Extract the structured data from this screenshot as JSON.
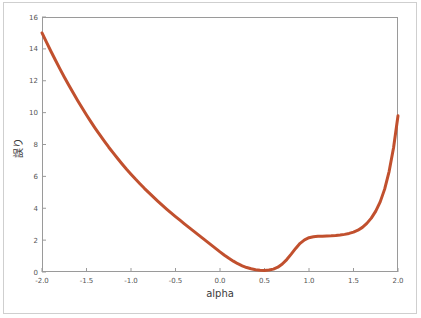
{
  "figure": {
    "background_color": "#ffffff",
    "border_color": "#cfcfcf",
    "axes_color": "#9a9a9a"
  },
  "chart_data": {
    "type": "line",
    "title": "",
    "xlabel": "alpha",
    "ylabel": "誤り",
    "xlim": [
      -2.0,
      2.0
    ],
    "ylim": [
      0,
      16
    ],
    "grid": false,
    "legend": null,
    "xticks": [
      "-2.0",
      "-1.5",
      "-1.0",
      "-0.5",
      "0.0",
      "0.5",
      "1.0",
      "1.5",
      "2.0"
    ],
    "xtick_values": [
      -2.0,
      -1.5,
      -1.0,
      -0.5,
      0.0,
      0.5,
      1.0,
      1.5,
      2.0
    ],
    "yticks": [
      "0",
      "2",
      "4",
      "6",
      "8",
      "10",
      "12",
      "14",
      "16"
    ],
    "ytick_values": [
      0,
      2,
      4,
      6,
      8,
      10,
      12,
      14,
      16
    ],
    "series": [
      {
        "name": "error",
        "color": "#c1502e",
        "linewidth": 3,
        "marker": "none",
        "x": [
          -2.0,
          -1.95,
          -1.9,
          -1.85,
          -1.8,
          -1.75,
          -1.7,
          -1.65,
          -1.6,
          -1.55,
          -1.5,
          -1.45,
          -1.4,
          -1.35,
          -1.3,
          -1.25,
          -1.2,
          -1.15,
          -1.1,
          -1.05,
          -1.0,
          -0.95,
          -0.9,
          -0.85,
          -0.8,
          -0.75,
          -0.7,
          -0.65,
          -0.6,
          -0.55,
          -0.5,
          -0.45,
          -0.4,
          -0.35,
          -0.3,
          -0.25,
          -0.2,
          -0.15,
          -0.1,
          -0.05,
          0.0,
          0.05,
          0.1,
          0.15,
          0.2,
          0.25,
          0.3,
          0.35,
          0.4,
          0.45,
          0.5,
          0.55,
          0.6,
          0.65,
          0.7,
          0.75,
          0.8,
          0.85,
          0.9,
          0.95,
          1.0,
          1.05,
          1.1,
          1.15,
          1.2,
          1.25,
          1.3,
          1.35,
          1.4,
          1.45,
          1.5,
          1.55,
          1.6,
          1.65,
          1.7,
          1.75,
          1.8,
          1.85,
          1.9,
          1.95,
          2.0
        ],
        "y": [
          15.0,
          14.42,
          13.85,
          13.3,
          12.76,
          12.24,
          11.73,
          11.24,
          10.76,
          10.3,
          9.85,
          9.42,
          9.0,
          8.6,
          8.21,
          7.83,
          7.47,
          7.12,
          6.78,
          6.45,
          6.14,
          5.83,
          5.54,
          5.25,
          4.98,
          4.71,
          4.45,
          4.2,
          3.95,
          3.71,
          3.48,
          3.25,
          3.02,
          2.8,
          2.58,
          2.36,
          2.14,
          1.92,
          1.7,
          1.48,
          1.26,
          1.05,
          0.86,
          0.68,
          0.52,
          0.39,
          0.28,
          0.2,
          0.14,
          0.11,
          0.1,
          0.12,
          0.18,
          0.3,
          0.5,
          0.78,
          1.12,
          1.48,
          1.8,
          2.02,
          2.15,
          2.21,
          2.24,
          2.25,
          2.26,
          2.27,
          2.29,
          2.32,
          2.36,
          2.42,
          2.5,
          2.62,
          2.8,
          3.05,
          3.38,
          3.82,
          4.4,
          5.2,
          6.3,
          7.8,
          9.8
        ]
      }
    ]
  }
}
